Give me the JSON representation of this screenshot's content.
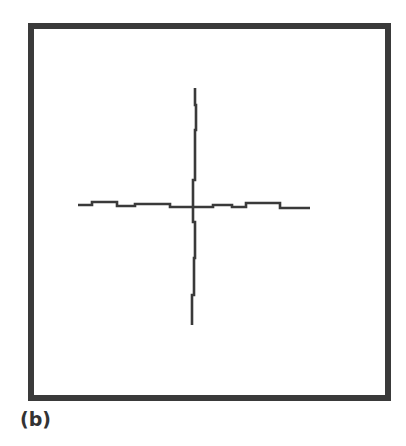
{
  "figure": {
    "label": "(b)",
    "frame_color": "#3a3a3a",
    "line_color": "#3a3a3a",
    "horizontal_trace": [
      [
        78,
        205
      ],
      [
        92,
        205
      ],
      [
        92,
        202
      ],
      [
        117,
        202
      ],
      [
        117,
        206
      ],
      [
        135,
        206
      ],
      [
        135,
        204
      ],
      [
        170,
        204
      ],
      [
        170,
        207
      ],
      [
        193,
        207
      ],
      [
        213,
        207
      ],
      [
        213,
        205
      ],
      [
        232,
        205
      ],
      [
        232,
        207
      ],
      [
        246,
        207
      ],
      [
        246,
        203
      ],
      [
        280,
        203
      ],
      [
        280,
        208
      ],
      [
        310,
        208
      ]
    ],
    "vertical_trace": [
      [
        195,
        88
      ],
      [
        195,
        105
      ],
      [
        196,
        105
      ],
      [
        196,
        130
      ],
      [
        195,
        130
      ],
      [
        195,
        180
      ],
      [
        193,
        180
      ],
      [
        193,
        207
      ],
      [
        193,
        222
      ],
      [
        195,
        222
      ],
      [
        195,
        258
      ],
      [
        194,
        258
      ],
      [
        194,
        295
      ],
      [
        192,
        295
      ],
      [
        192,
        325
      ]
    ]
  }
}
